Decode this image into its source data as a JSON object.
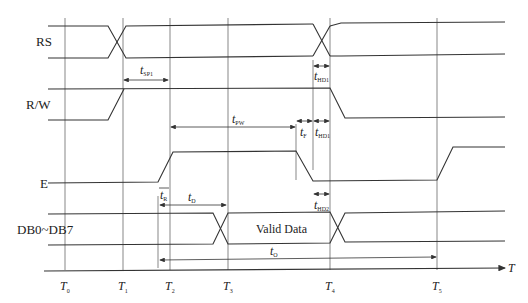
{
  "diagram": {
    "type": "timing-diagram",
    "signals": [
      {
        "label": "RS"
      },
      {
        "label": "R/W"
      },
      {
        "label": "E"
      },
      {
        "label": "DB0~DB7"
      }
    ],
    "data_label": "Valid Data",
    "time_axis": {
      "label": "T",
      "ticks": [
        {
          "base": "T",
          "sub": "0"
        },
        {
          "base": "T",
          "sub": "1"
        },
        {
          "base": "T",
          "sub": "2"
        },
        {
          "base": "T",
          "sub": "3"
        },
        {
          "base": "T",
          "sub": "4"
        },
        {
          "base": "T",
          "sub": "5"
        }
      ]
    },
    "timing_params": {
      "tsp1": {
        "base": "t",
        "sub": "SP1"
      },
      "tpw": {
        "base": "t",
        "sub": "PW"
      },
      "tf": {
        "base": "t",
        "sub": "F"
      },
      "thd1": {
        "base": "t",
        "sub": "HD1"
      },
      "thd1_rw": {
        "base": "t",
        "sub": "HD1"
      },
      "thd2": {
        "base": "t",
        "sub": "HD2"
      },
      "tr": {
        "base": "t",
        "sub": "R"
      },
      "td": {
        "base": "t",
        "sub": "D"
      },
      "to": {
        "base": "t",
        "sub": "O"
      }
    }
  }
}
